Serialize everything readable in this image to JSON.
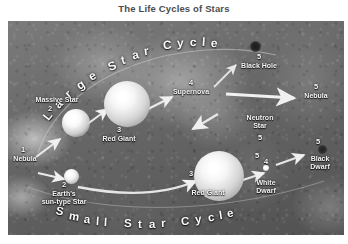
{
  "figure": {
    "title": "The Life Cycles of Stars",
    "type": "diagram"
  },
  "arcs": {
    "large_cycle": {
      "text": "Large Star Cycle",
      "letters": [
        "L",
        "a",
        "r",
        "g",
        "e",
        "S",
        "t",
        "a",
        "r",
        "C",
        "y",
        "c",
        "l",
        "e"
      ],
      "position": "top"
    },
    "small_cycle": {
      "text": "Small Star Cycle",
      "letters": [
        "S",
        "m",
        "a",
        "l",
        "l",
        "S",
        "t",
        "a",
        "r",
        "C",
        "y",
        "c",
        "l",
        "e"
      ],
      "position": "bottom"
    }
  },
  "stages": {
    "large": [
      {
        "num": "1",
        "label": "Nebula"
      },
      {
        "num": "2",
        "label": "Massive Star"
      },
      {
        "num": "3",
        "label": "Red Giant"
      },
      {
        "num": "4",
        "label": "Supernova"
      },
      {
        "num": "5",
        "label": "Black Hole"
      },
      {
        "num": "5",
        "label": "Neutron Star"
      },
      {
        "num": "5",
        "label": "Nebula"
      }
    ],
    "small": [
      {
        "num": "1",
        "label": "Nebula"
      },
      {
        "num": "2",
        "label": "Earth's sun-type Star",
        "line1": "Earth's",
        "line2": "sun-type Star"
      },
      {
        "num": "3",
        "label": "Red Giant"
      },
      {
        "num": "4",
        "label": "White Dwarf",
        "line1": "White",
        "line2": "Dwarf"
      },
      {
        "num": "5",
        "label": "Black Dwarf",
        "line1": "Black",
        "line2": "Dwarf"
      }
    ]
  },
  "labels": {
    "nebula_left": "Nebula",
    "nebula_left_num": "1",
    "massive_star": "Massive Star",
    "massive_star_num": "2",
    "red_giant_top": "Red Giant",
    "red_giant_top_num": "3",
    "supernova": "Supernova",
    "supernova_num": "4",
    "black_hole": "Black Hole",
    "black_hole_num": "5",
    "neutron_star_l1": "Neutron",
    "neutron_star_l2": "Star",
    "neutron_star_num": "5",
    "nebula_right": "Nebula",
    "nebula_right_num": "5",
    "sun_type_l1": "Earth's",
    "sun_type_l2": "sun-type Star",
    "sun_type_num": "2",
    "red_giant_bottom": "Red Giant",
    "red_giant_bottom_num": "3",
    "white_dwarf_l1": "White",
    "white_dwarf_l2": "Dwarf",
    "white_dwarf_num": "4",
    "white_dwarf_num_above": "5",
    "black_dwarf_l1": "Black",
    "black_dwarf_l2": "Dwarf",
    "black_dwarf_num": "5"
  },
  "colors": {
    "title_text": "#4c4c4c",
    "label_text": "#f2f2f2",
    "plate_background": "#6e6e6e",
    "page_background": "#ffffff",
    "arrow": "#e8e8e8"
  }
}
